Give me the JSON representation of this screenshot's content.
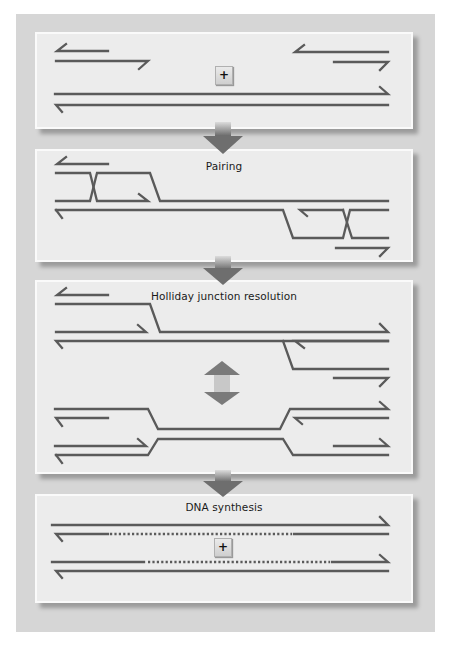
{
  "figure": {
    "panels": [
      {
        "id": "input",
        "label": "",
        "symbol": "+"
      },
      {
        "id": "pairing",
        "label": "Pairing"
      },
      {
        "id": "resolution",
        "label": "Holliday junction resolution"
      },
      {
        "id": "synthesis",
        "label": "DNA synthesis",
        "symbol": "+"
      }
    ],
    "arrows": [
      "down-arrow",
      "down-arrow",
      "double-arrow",
      "down-arrow"
    ],
    "colors": {
      "strand_dark": "#585858",
      "strand_light": "#7a7a7a",
      "panel_bg": "#ececec",
      "frame_bg": "#d6d6d6"
    }
  }
}
